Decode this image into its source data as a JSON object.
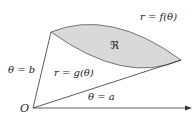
{
  "diagram": {
    "labels": {
      "outer_curve": "r = f(θ)",
      "inner_curve": "r = g(θ)",
      "region": "ℜ",
      "ray_b": "θ = b",
      "ray_a": "θ = a",
      "origin": "O"
    },
    "colors": {
      "region_fill": "#d9d9d9",
      "stroke": "#333333",
      "text": "#222222"
    }
  }
}
